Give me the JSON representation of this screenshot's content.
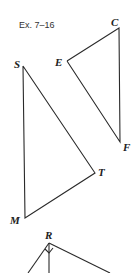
{
  "figure": {
    "caption": "Ex. 7–16",
    "triangles": [
      {
        "name": "triangle-ECF",
        "vertices": [
          "E",
          "C",
          "F"
        ]
      },
      {
        "name": "triangle-SMT",
        "vertices": [
          "S",
          "M",
          "T"
        ]
      },
      {
        "name": "triangle-R-partial",
        "vertices": [
          "R"
        ],
        "note": "right-angle mark at R, altitude drawn"
      }
    ],
    "labels": {
      "C": "C",
      "E": "E",
      "F": "F",
      "S": "S",
      "T": "T",
      "M": "M",
      "R": "R"
    }
  }
}
